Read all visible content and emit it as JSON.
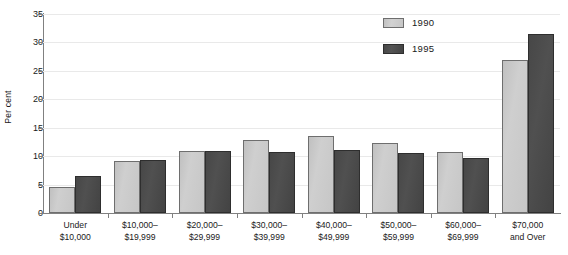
{
  "chart_data": {
    "type": "bar",
    "title": "",
    "xlabel": "",
    "ylabel": "Per cent",
    "ylim": [
      0,
      35
    ],
    "yticks": [
      0,
      5,
      10,
      15,
      20,
      25,
      30,
      35
    ],
    "grid": true,
    "legend_position": "top-right",
    "categories": [
      "Under $10,000",
      "$10,000–$19,999",
      "$20,000–$29,999",
      "$30,000–$39,999",
      "$40,000–$49,999",
      "$50,000–$59,999",
      "$60,000–$69,999",
      "$70,000 and Over"
    ],
    "category_lines": [
      [
        "Under",
        "$10,000"
      ],
      [
        "$10,000–",
        "$19,999"
      ],
      [
        "$20,000–",
        "$29,999"
      ],
      [
        "$30,000–",
        "$39,999"
      ],
      [
        "$40,000–",
        "$49,999"
      ],
      [
        "$50,000–",
        "$59,999"
      ],
      [
        "$60,000–",
        "$69,999"
      ],
      [
        "$70,000",
        "and Over"
      ]
    ],
    "series": [
      {
        "name": "1990",
        "color": "#c8c8c8",
        "values": [
          4.6,
          9.1,
          10.9,
          12.8,
          13.5,
          12.3,
          10.8,
          26.9
        ]
      },
      {
        "name": "1995",
        "color": "#4a4a4a",
        "values": [
          6.5,
          9.3,
          10.9,
          10.7,
          11.0,
          10.5,
          9.7,
          31.5
        ]
      }
    ]
  },
  "legend": {
    "items": [
      {
        "label": "1990"
      },
      {
        "label": "1995"
      }
    ]
  },
  "axis": {
    "y_title": "Per cent"
  }
}
